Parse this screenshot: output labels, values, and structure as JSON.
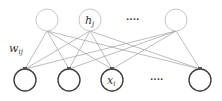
{
  "diagram": {
    "type": "bipartite-network",
    "hidden_layer": {
      "nodes": [
        {
          "id": "h1",
          "cx": 47,
          "cy": 20,
          "label": ""
        },
        {
          "id": "hj",
          "cx": 90,
          "cy": 20,
          "label": "h",
          "sub": "j"
        },
        {
          "id": "hn",
          "cx": 176,
          "cy": 20,
          "label": ""
        }
      ],
      "ellipsis": "····",
      "stroke": "#c8c8c8"
    },
    "visible_layer": {
      "nodes": [
        {
          "id": "x1",
          "cx": 25,
          "cy": 80,
          "label": ""
        },
        {
          "id": "x2",
          "cx": 69,
          "cy": 80,
          "label": ""
        },
        {
          "id": "xi",
          "cx": 112,
          "cy": 80,
          "label": "x",
          "sub": "i"
        },
        {
          "id": "xn",
          "cx": 200,
          "cy": 80,
          "label": ""
        }
      ],
      "ellipsis": "····",
      "stroke": "#404040"
    },
    "weight_label": {
      "text": "w",
      "sub": "ij"
    },
    "edge_color": "#a0a0a0"
  }
}
